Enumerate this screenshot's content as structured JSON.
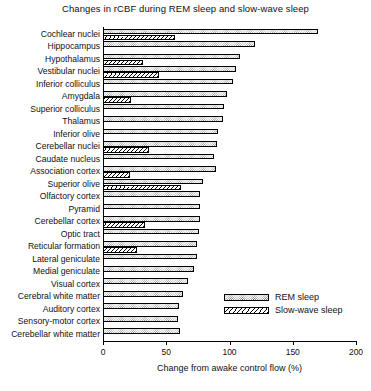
{
  "chart_data": {
    "type": "bar",
    "orientation": "horizontal",
    "title": "Changes in rCBF during REM sleep and slow-wave sleep",
    "xlabel": "Change from awake control flow (%)",
    "ylabel": "",
    "xlim": [
      0,
      200
    ],
    "xticks": [
      0,
      50,
      100,
      150,
      200
    ],
    "xtick_labels": [
      "0",
      "50",
      "100",
      "150",
      "200"
    ],
    "grid": false,
    "legend_position": "middle-right",
    "categories": [
      "Cochlear nuclei",
      "Hippocampus",
      "Hypothalamus",
      "Vestibular nuclei",
      "Inferior colliculus",
      "Amygdala",
      "Superior colliculus",
      "Thalamus",
      "Inferior olive",
      "Cerebellar nuclei",
      "Caudate nucleus",
      "Association cortex",
      "Superior olive",
      "Olfactory cortex",
      "Pyramid",
      "Cerebellar cortex",
      "Optic tract",
      "Reticular formation",
      "Lateral geniculate",
      "Medial geniculate",
      "Visual cortex",
      "Cerebral white matter",
      "Auditory cortex",
      "Sensory-motor cortex",
      "Cerebellar white matter"
    ],
    "series": [
      {
        "name": "REM sleep",
        "values": [
          170,
          120,
          108,
          105,
          103,
          98,
          96,
          95,
          91,
          90,
          88,
          89,
          79,
          77,
          77,
          77,
          76,
          74,
          74,
          72,
          67,
          63,
          60,
          59,
          61
        ]
      },
      {
        "name": "Slow-wave sleep",
        "values": [
          57,
          null,
          32,
          44,
          null,
          22,
          null,
          null,
          null,
          36,
          null,
          21,
          62,
          null,
          null,
          33,
          null,
          27,
          null,
          null,
          null,
          null,
          null,
          null,
          null
        ]
      }
    ]
  },
  "legend": {
    "items": [
      {
        "label": "REM sleep",
        "pattern": "stipple"
      },
      {
        "label": "Slow-wave sleep",
        "pattern": "hatch"
      }
    ]
  }
}
